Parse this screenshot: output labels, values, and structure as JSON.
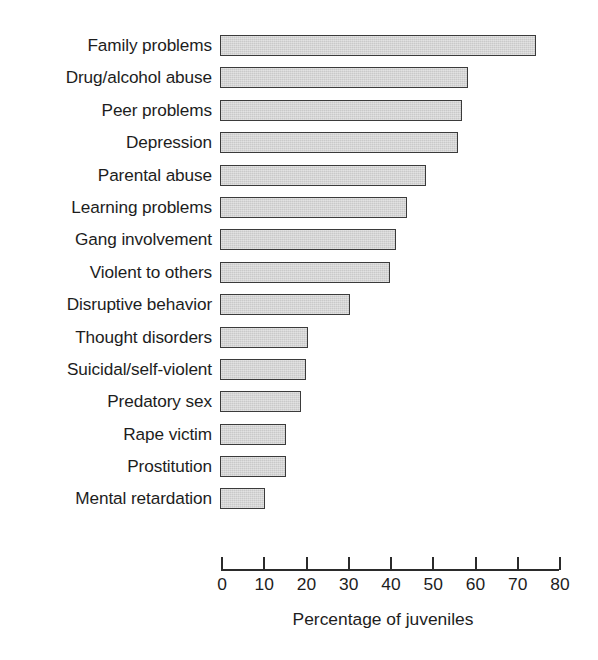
{
  "chart_data": {
    "type": "bar",
    "orientation": "horizontal",
    "title": "",
    "xlabel": "Percentage of juveniles",
    "ylabel": "",
    "xlim": [
      0,
      80
    ],
    "xticks": [
      0,
      10,
      20,
      30,
      40,
      50,
      60,
      70,
      80
    ],
    "grid": false,
    "legend": null,
    "bar_fill_color": "#c9c9c9",
    "bar_edge_color": "#3b3b3b",
    "categories": [
      "Family problems",
      "Drug/alcohol abuse",
      "Peer problems",
      "Depression",
      "Parental abuse",
      "Learning problems",
      "Gang involvement",
      "Violent to others",
      "Disruptive behavior",
      "Thought disorders",
      "Suicidal/self-violent",
      "Predatory sex",
      "Rape victim",
      "Prostitution",
      "Mental retardation"
    ],
    "values": [
      74.5,
      58.5,
      57,
      56,
      48.5,
      44,
      41.5,
      40,
      30.5,
      20.5,
      20,
      19,
      15.5,
      15.5,
      10.5
    ]
  },
  "axis": {
    "tick_labels": [
      "0",
      "10",
      "20",
      "30",
      "40",
      "50",
      "60",
      "70",
      "80"
    ],
    "title": "Percentage of juveniles"
  }
}
